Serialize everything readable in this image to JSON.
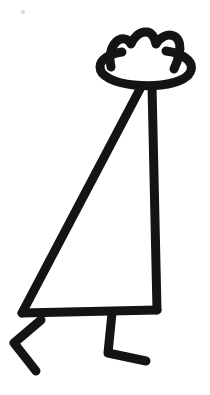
{
  "artwork": {
    "title": "Stick figure wearing a wide-brimmed hat",
    "subject": "person",
    "style": "black outline line art",
    "medium": "monochrome drawing",
    "caption": "",
    "canvas": {
      "width": 210,
      "height": 395,
      "background_color": "#ffffff"
    },
    "ink_color": "#141414",
    "stroke_width": 9,
    "parts": [
      {
        "name": "hat",
        "label": "Wide-brimmed lumpy hat",
        "crown_bumps": 3,
        "brim_left_x": 99,
        "brim_right_x": 193,
        "brim_center_y": 70
      },
      {
        "name": "torso",
        "label": "Triangular body",
        "apex_x": 143,
        "apex_y": 88,
        "base_left_x": 22,
        "base_right_x": 157,
        "base_y": 313
      },
      {
        "name": "left-leg",
        "label": "Left leg bent at knee",
        "hip_x": 40,
        "knee_x": 14,
        "knee_y": 343,
        "foot_tip_x": 36,
        "foot_tip_y": 371
      },
      {
        "name": "right-leg",
        "label": "Right leg with forward foot",
        "hip_x": 112,
        "ankle_y": 353,
        "foot_tip_x": 146,
        "foot_tip_y": 361
      }
    ],
    "speck": {
      "x": 23,
      "y": 12,
      "r": 2
    }
  }
}
